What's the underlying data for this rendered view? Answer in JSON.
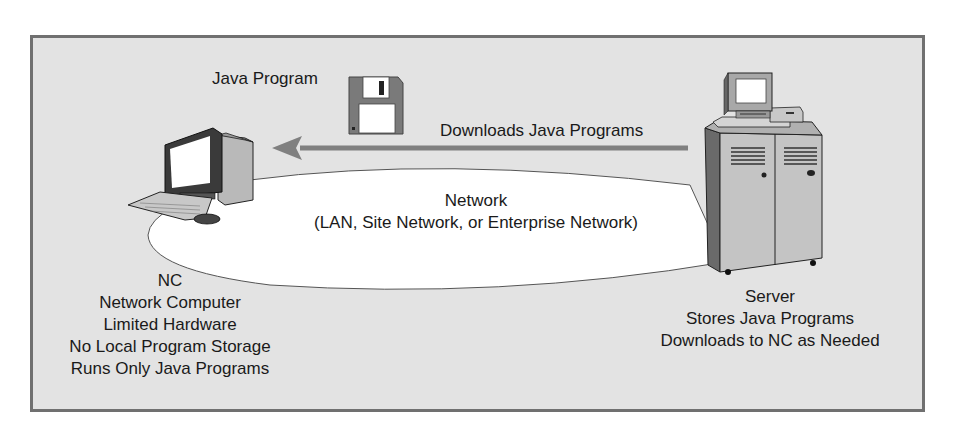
{
  "diagram": {
    "java_program_label": "Java Program",
    "arrow_label": "Downloads Java Programs",
    "network": {
      "title": "Network",
      "subtitle": "(LAN, Site Network, or Enterprise Network)"
    },
    "client": {
      "lines": [
        "NC",
        "Network Computer",
        "Limited Hardware",
        "No Local Program Storage",
        "Runs Only Java Programs"
      ]
    },
    "server": {
      "lines": [
        "Server",
        "Stores Java Programs",
        "Downloads to NC as Needed"
      ]
    },
    "icons": {
      "floppy": "floppy-disk-icon",
      "client_computer": "desktop-computer-icon",
      "server_computer": "server-cabinet-icon",
      "arrow": "arrow-left-icon"
    },
    "colors": {
      "background": "#e3e3e3",
      "border": "#707070",
      "arrow": "#808080",
      "network_fill": "#ffffff"
    }
  }
}
